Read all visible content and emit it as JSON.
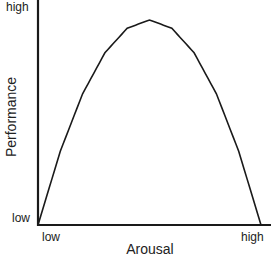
{
  "chart_data": {
    "type": "line",
    "title": "",
    "xlabel": "Arousal",
    "ylabel": "Performance",
    "x_ticks": [
      "low",
      "high"
    ],
    "y_ticks": [
      "low",
      "high"
    ],
    "xlim": [
      0,
      1
    ],
    "ylim": [
      0,
      1
    ],
    "grid": false,
    "legend": null,
    "series": [
      {
        "name": "Performance vs Arousal",
        "shape": "inverted-U",
        "x": [
          0.0,
          0.1,
          0.2,
          0.3,
          0.4,
          0.5,
          0.6,
          0.7,
          0.8,
          0.9,
          1.0
        ],
        "y": [
          0.0,
          0.36,
          0.64,
          0.84,
          0.96,
          1.0,
          0.96,
          0.84,
          0.64,
          0.36,
          0.0
        ]
      }
    ],
    "line_color": "#1a1a1a",
    "axis_color": "#1a1a1a"
  },
  "labels": {
    "y_high": "high",
    "y_low": "low",
    "x_low": "low",
    "x_high": "high",
    "x_title": "Arousal",
    "y_title": "Performance"
  }
}
